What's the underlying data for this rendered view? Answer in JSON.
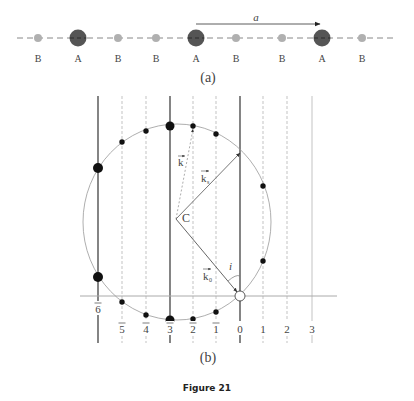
{
  "panel_a": {
    "label": "(a)",
    "lattice_vector_label": "a",
    "atoms": [
      {
        "type": "B",
        "x": 38
      },
      {
        "type": "A",
        "x": 78
      },
      {
        "type": "B",
        "x": 118
      },
      {
        "type": "B",
        "x": 156
      },
      {
        "type": "A",
        "x": 196
      },
      {
        "type": "B",
        "x": 236
      },
      {
        "type": "B",
        "x": 282
      },
      {
        "type": "A",
        "x": 322
      },
      {
        "type": "B",
        "x": 362
      }
    ]
  },
  "panel_b": {
    "label": "(b)",
    "center_label": "C",
    "vectors": {
      "k": "k",
      "ks": "k",
      "ks_sub": "s",
      "k0": "k",
      "k0_sub": "0"
    },
    "angle_label": "i",
    "order_labels": [
      {
        "text": "6",
        "bar": true,
        "x": 98,
        "solid": true
      },
      {
        "text": "5",
        "bar": true,
        "x": 122,
        "solid": false
      },
      {
        "text": "4",
        "bar": true,
        "x": 146,
        "solid": false
      },
      {
        "text": "3",
        "bar": true,
        "x": 170,
        "solid": true
      },
      {
        "text": "2",
        "bar": true,
        "x": 193,
        "solid": false
      },
      {
        "text": "1",
        "bar": true,
        "x": 216,
        "solid": false
      },
      {
        "text": "0",
        "bar": false,
        "x": 240,
        "solid": true
      },
      {
        "text": "1",
        "bar": false,
        "x": 263,
        "solid": false
      },
      {
        "text": "2",
        "bar": false,
        "x": 287,
        "solid": false
      },
      {
        "text": "3",
        "bar": false,
        "x": 312,
        "solid": false
      }
    ]
  },
  "caption": "Figure 21",
  "colors": {
    "atom_A": "#555555",
    "atom_B": "#b0b0b0",
    "line": "#333333",
    "grid": "#aaaaaa"
  }
}
